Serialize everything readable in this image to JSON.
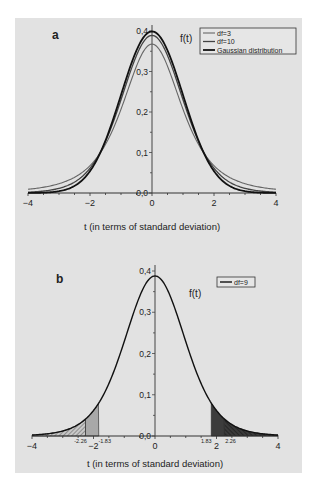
{
  "chart_data": [
    {
      "panel": "a",
      "type": "line",
      "title": "",
      "panel_label": "a",
      "xlabel": "t (in terms of standard deviation)",
      "ylabel": "f(t)",
      "xlim": [
        -4,
        4
      ],
      "ylim": [
        0,
        0.4
      ],
      "xticks": [
        "-4",
        "-2",
        "0",
        "2",
        "4"
      ],
      "yticks": [
        "0,0",
        "0,1",
        "0,2",
        "0,3",
        "0,4"
      ],
      "grid": false,
      "legend_position": "top-right",
      "series": [
        {
          "name": "df=3",
          "kind": "student-t",
          "df": 3,
          "peak": 0.368,
          "color": "#666666"
        },
        {
          "name": "df=10",
          "kind": "student-t",
          "df": 10,
          "peak": 0.389,
          "color": "#444444"
        },
        {
          "name": "Gaussian distribution",
          "kind": "normal",
          "peak": 0.399,
          "color": "#111111"
        }
      ]
    },
    {
      "panel": "b",
      "type": "area",
      "title": "",
      "panel_label": "b",
      "xlabel": "t (in terms of standard deviation)",
      "ylabel": "f(t)",
      "xlim": [
        -4,
        4
      ],
      "ylim": [
        0,
        0.4
      ],
      "xticks": [
        "-4",
        "-2",
        "0",
        "2",
        "4"
      ],
      "yticks": [
        "0,0",
        "0,1",
        "0,2",
        "0,3",
        "0,4"
      ],
      "grid": false,
      "legend_position": "top-right",
      "series": [
        {
          "name": "df=9",
          "kind": "student-t",
          "df": 9,
          "peak": 0.388,
          "color": "#111111"
        }
      ],
      "shaded_regions": [
        {
          "from": -4,
          "to": -2.26,
          "style": "hatched-light"
        },
        {
          "from": -2.26,
          "to": -1.83,
          "style": "light-gray"
        },
        {
          "from": 1.83,
          "to": 2.26,
          "style": "dark-gray"
        },
        {
          "from": 2.26,
          "to": 4,
          "style": "hatched-dark"
        }
      ],
      "annotations": [
        "-2.26",
        "-1.83",
        "1.83",
        "2.26"
      ]
    }
  ],
  "panel_a": {
    "label": "a",
    "ylabel": "f(t)",
    "xlabel": "t (in terms of standard deviation)",
    "legend": [
      "df=3",
      "df=10",
      "Gaussian distribution"
    ]
  },
  "panel_b": {
    "label": "b",
    "ylabel": "f(t)",
    "xlabel": "t (in terms of standard deviation)",
    "legend": [
      "df=9"
    ],
    "critical_labels": [
      "-2.26",
      "-1.83",
      "1.83",
      "2.26"
    ]
  }
}
